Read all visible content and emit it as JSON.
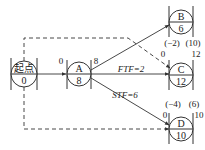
{
  "diagram": {
    "type": "single-code network (precedence diagram)",
    "nodes": [
      {
        "id": "start",
        "name": "起点",
        "duration": "0"
      },
      {
        "id": "A",
        "name": "A",
        "duration": "8"
      },
      {
        "id": "B",
        "name": "B",
        "duration": "6"
      },
      {
        "id": "C",
        "name": "C",
        "duration": "12"
      },
      {
        "id": "D",
        "name": "D",
        "duration": "10"
      }
    ],
    "labels": {
      "A_es": "0",
      "A_ef": "8",
      "B_es": "(−2)",
      "B_ef": "(10)",
      "C_es": "0",
      "C_ef": "12",
      "D_es_paren": "(−4)",
      "D_ef_paren": "(6)",
      "D_es": "0",
      "D_ef": "10"
    },
    "links": [
      {
        "from": "start",
        "to": "A",
        "style": "solid",
        "label": ""
      },
      {
        "from": "A",
        "to": "B",
        "style": "solid",
        "label": ""
      },
      {
        "from": "A",
        "to": "C",
        "style": "solid",
        "label": "FTF=2"
      },
      {
        "from": "A",
        "to": "D",
        "style": "solid",
        "label": "STF=6"
      },
      {
        "from": "start",
        "to": "C",
        "style": "dashed",
        "label": ""
      },
      {
        "from": "start",
        "to": "D",
        "style": "dashed",
        "label": ""
      }
    ]
  }
}
